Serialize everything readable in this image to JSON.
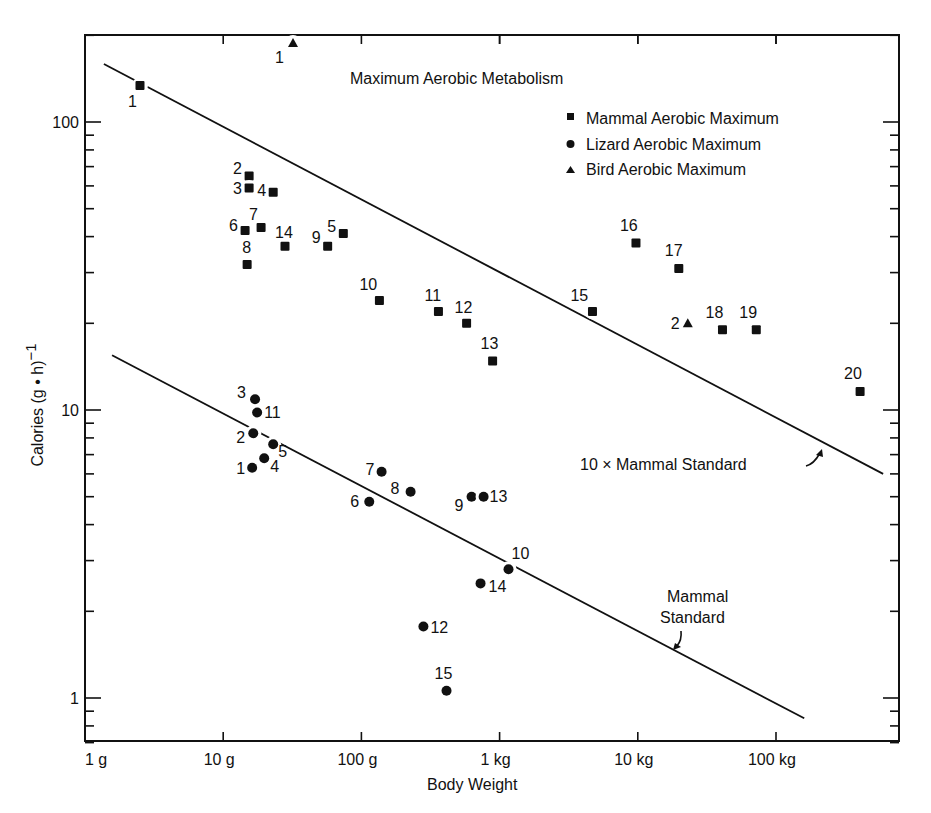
{
  "chart_data": {
    "type": "scatter",
    "title": "Maximum Aerobic Metabolism",
    "xlabel": "Body Weight",
    "ylabel": "Calories (g • h)−1",
    "xscale": "log",
    "yscale": "log",
    "xlim_g": [
      1,
      750
    ],
    "xlim_note": "x axis spans 1 g to ~750 kg",
    "ylim": [
      0.7,
      200
    ],
    "x_ticks": [
      {
        "value_g": 1,
        "label": "1 g"
      },
      {
        "value_g": 10,
        "label": "10 g"
      },
      {
        "value_g": 100,
        "label": "100 g"
      },
      {
        "value_g": 1000,
        "label": "1 kg"
      },
      {
        "value_g": 10000,
        "label": "10 kg"
      },
      {
        "value_g": 100000,
        "label": "100 kg"
      }
    ],
    "y_ticks": [
      {
        "value": 1,
        "label": "1"
      },
      {
        "value": 10,
        "label": "10"
      },
      {
        "value": 100,
        "label": "100"
      }
    ],
    "grid": false,
    "legend_position": "upper right",
    "legend": [
      {
        "marker": "square",
        "label": "Mammal Aerobic Maximum"
      },
      {
        "marker": "circle",
        "label": "Lizard Aerobic Maximum"
      },
      {
        "marker": "triangle",
        "label": "Bird Aerobic Maximum"
      }
    ],
    "series": [
      {
        "name": "Mammal Aerobic Maximum",
        "marker": "square",
        "points": [
          {
            "id": "1",
            "x_g": 2.5,
            "y": 134,
            "lx": -12,
            "ly": 22
          },
          {
            "id": "2",
            "x_g": 15.4,
            "y": 65,
            "lx": -16,
            "ly": -2
          },
          {
            "id": "3",
            "x_g": 15.4,
            "y": 59,
            "lx": -16,
            "ly": 6
          },
          {
            "id": "4",
            "x_g": 23,
            "y": 57,
            "lx": -16,
            "ly": 4
          },
          {
            "id": "5",
            "x_g": 74,
            "y": 41,
            "lx": -16,
            "ly": -2
          },
          {
            "id": "6",
            "x_g": 14.4,
            "y": 42,
            "lx": -16,
            "ly": 0
          },
          {
            "id": "7",
            "x_g": 18.8,
            "y": 43,
            "lx": -12,
            "ly": -8
          },
          {
            "id": "8",
            "x_g": 14.9,
            "y": 32,
            "lx": -5,
            "ly": -12
          },
          {
            "id": "9",
            "x_g": 57,
            "y": 37,
            "lx": -16,
            "ly": -3
          },
          {
            "id": "10",
            "x_g": 135,
            "y": 24,
            "lx": -20,
            "ly": -10
          },
          {
            "id": "11",
            "x_g": 361,
            "y": 22,
            "lx": -14,
            "ly": -10
          },
          {
            "id": "12",
            "x_g": 577,
            "y": 20,
            "lx": -12,
            "ly": -10
          },
          {
            "id": "13",
            "x_g": 890,
            "y": 14.8,
            "lx": -12,
            "ly": -12
          },
          {
            "id": "14",
            "x_g": 28,
            "y": 37,
            "lx": -10,
            "ly": -8
          },
          {
            "id": "15",
            "x_g": 4700,
            "y": 22,
            "lx": -22,
            "ly": -10
          },
          {
            "id": "16",
            "x_g": 9700,
            "y": 38,
            "lx": -16,
            "ly": -12
          },
          {
            "id": "17",
            "x_g": 19800,
            "y": 31,
            "lx": -14,
            "ly": -12
          },
          {
            "id": "18",
            "x_g": 41000,
            "y": 19,
            "lx": -17,
            "ly": -12
          },
          {
            "id": "19",
            "x_g": 72000,
            "y": 19,
            "lx": -17,
            "ly": -12
          },
          {
            "id": "20",
            "x_g": 406000,
            "y": 11.6,
            "lx": -16,
            "ly": -12
          }
        ]
      },
      {
        "name": "Lizard Aerobic Maximum",
        "marker": "circle",
        "points": [
          {
            "id": "1",
            "x_g": 16.2,
            "y": 6.3,
            "lx": -16,
            "ly": 6
          },
          {
            "id": "2",
            "x_g": 16.5,
            "y": 8.3,
            "lx": -17,
            "ly": 10
          },
          {
            "id": "3",
            "x_g": 17,
            "y": 10.9,
            "lx": -18,
            "ly": -1
          },
          {
            "id": "4",
            "x_g": 19.8,
            "y": 6.8,
            "lx": 6,
            "ly": 14
          },
          {
            "id": "5",
            "x_g": 23,
            "y": 7.6,
            "lx": 5,
            "ly": 13
          },
          {
            "id": "6",
            "x_g": 114,
            "y": 4.8,
            "lx": -19,
            "ly": 5
          },
          {
            "id": "7",
            "x_g": 140,
            "y": 6.1,
            "lx": -16,
            "ly": 3
          },
          {
            "id": "8",
            "x_g": 227,
            "y": 5.2,
            "lx": -20,
            "ly": 2
          },
          {
            "id": "9",
            "x_g": 627,
            "y": 5.0,
            "lx": -17,
            "ly": 14
          },
          {
            "id": "10",
            "x_g": 1160,
            "y": 2.8,
            "lx": 3,
            "ly": -10
          },
          {
            "id": "11",
            "x_g": 17.6,
            "y": 9.8,
            "lx": 7,
            "ly": 5
          },
          {
            "id": "12",
            "x_g": 281,
            "y": 1.77,
            "lx": 7,
            "ly": 6
          },
          {
            "id": "13",
            "x_g": 766,
            "y": 5.0,
            "lx": 6,
            "ly": 5
          },
          {
            "id": "14",
            "x_g": 728,
            "y": 2.5,
            "lx": 8,
            "ly": 9
          },
          {
            "id": "15",
            "x_g": 413,
            "y": 1.06,
            "lx": -12,
            "ly": -12
          }
        ]
      },
      {
        "name": "Bird Aerobic Maximum",
        "marker": "triangle",
        "points": [
          {
            "id": "1",
            "x_g": 32,
            "y": 188,
            "lx": -18,
            "ly": 20
          },
          {
            "id": "2",
            "x_g": 23000,
            "y": 20,
            "lx": -17,
            "ly": 6
          }
        ]
      }
    ],
    "lines": [
      {
        "name": "10 X Mammal Standard",
        "from": {
          "x_g": 1.37,
          "y": 159
        },
        "to": {
          "x_g": 596000,
          "y": 6.0
        }
      },
      {
        "name": "Mammal Standard",
        "from": {
          "x_g": 1.57,
          "y": 15.5
        },
        "to": {
          "x_g": 160000,
          "y": 0.85
        }
      }
    ],
    "annotations": [
      {
        "text": "10 X Mammal Standard",
        "x_px": 580,
        "y_px": 470
      },
      {
        "text": "Mammal Standard",
        "lines": [
          "Mammal",
          "Standard"
        ],
        "x_px": 690,
        "y_px": 602
      }
    ]
  },
  "labels": {
    "title": "Maximum Aerobic Metabolism",
    "xlabel": "Body Weight",
    "ylabel": "Calories (g • h)",
    "ylabel_sup": "−1",
    "legend_mammal": "Mammal Aerobic Maximum",
    "legend_lizard": "Lizard Aerobic Maximum",
    "legend_bird": "Bird Aerobic Maximum",
    "annot_10x": "10 × Mammal Standard",
    "annot_std_1": "Mammal",
    "annot_std_2": "Standard"
  }
}
